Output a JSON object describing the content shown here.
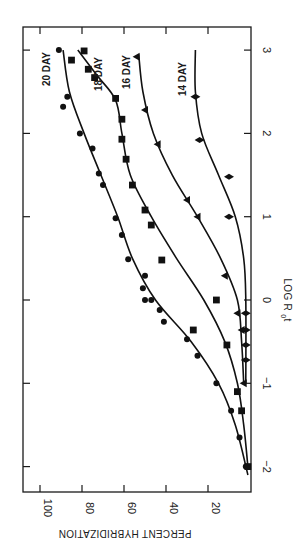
{
  "chart_data": {
    "type": "line",
    "orientation_note_visible": "figure printed rotated 90 degrees clockwise",
    "title": "",
    "xlabel": "LOG R0t",
    "ylabel": "PERCENT HYBRIDIZATION",
    "xlim": [
      -2,
      3
    ],
    "ylim": [
      0,
      100
    ],
    "x_ticks": [
      -2,
      -1,
      0,
      1,
      2,
      3
    ],
    "x_tick_labels": [
      "-2",
      "-1",
      "0",
      "1",
      "2",
      "3"
    ],
    "y_ticks": [
      20,
      40,
      60,
      80,
      100
    ],
    "y_tick_labels": [
      "20",
      "40",
      "60",
      "80",
      "100"
    ],
    "grid": false,
    "legend": "inline labels at curve ends",
    "series": [
      {
        "name": "20 DAY",
        "marker": "circle",
        "points": [
          [
            -2.0,
            2
          ],
          [
            -1.65,
            5
          ],
          [
            -1.33,
            9
          ],
          [
            -1.0,
            16
          ],
          [
            -0.67,
            25
          ],
          [
            -0.47,
            30
          ],
          [
            -0.26,
            41
          ],
          [
            -0.12,
            43
          ],
          [
            0.0,
            47
          ],
          [
            0.0,
            50
          ],
          [
            0.14,
            51
          ],
          [
            0.29,
            50
          ],
          [
            0.49,
            58
          ],
          [
            0.78,
            61
          ],
          [
            0.98,
            64
          ],
          [
            1.38,
            70
          ],
          [
            1.52,
            72
          ],
          [
            1.82,
            75
          ],
          [
            2.0,
            81
          ],
          [
            2.32,
            89
          ],
          [
            2.44,
            87
          ],
          [
            3.0,
            91
          ]
        ],
        "curve": [
          [
            -2.1,
            1
          ],
          [
            -1.5,
            7
          ],
          [
            -1.0,
            15
          ],
          [
            -0.5,
            28
          ],
          [
            0.0,
            45
          ],
          [
            0.5,
            56
          ],
          [
            1.0,
            63
          ],
          [
            1.5,
            71
          ],
          [
            2.0,
            79
          ],
          [
            2.5,
            86
          ],
          [
            3.0,
            89
          ]
        ]
      },
      {
        "name": "18 DAY",
        "marker": "square",
        "points": [
          [
            -2.0,
            1
          ],
          [
            -1.33,
            4
          ],
          [
            -1.1,
            6
          ],
          [
            -0.54,
            11
          ],
          [
            -0.36,
            27
          ],
          [
            0.0,
            16
          ],
          [
            0.48,
            42
          ],
          [
            0.9,
            47
          ],
          [
            1.08,
            50
          ],
          [
            1.38,
            56
          ],
          [
            1.69,
            59
          ],
          [
            1.93,
            61
          ],
          [
            2.17,
            61
          ],
          [
            2.42,
            64
          ],
          [
            2.67,
            74
          ],
          [
            2.77,
            77
          ],
          [
            2.88,
            85
          ],
          [
            2.99,
            79
          ]
        ],
        "curve": [
          [
            -2.0,
            1
          ],
          [
            -1.5,
            3
          ],
          [
            -1.0,
            6
          ],
          [
            -0.5,
            12
          ],
          [
            0.0,
            22
          ],
          [
            0.5,
            35
          ],
          [
            1.0,
            47
          ],
          [
            1.5,
            57
          ],
          [
            2.0,
            61
          ],
          [
            2.4,
            64
          ],
          [
            2.7,
            73
          ],
          [
            3.0,
            82
          ]
        ]
      },
      {
        "name": "16 DAY",
        "marker": "triangle",
        "points": [
          [
            -1.0,
            3
          ],
          [
            -0.36,
            4
          ],
          [
            -0.16,
            6
          ],
          [
            0.29,
            12
          ],
          [
            1.0,
            25
          ],
          [
            1.2,
            30
          ],
          [
            1.87,
            44
          ],
          [
            2.28,
            50
          ],
          [
            2.92,
            54
          ]
        ],
        "curve": [
          [
            -1.0,
            3
          ],
          [
            -0.5,
            4
          ],
          [
            0.0,
            6
          ],
          [
            0.5,
            14
          ],
          [
            1.0,
            25
          ],
          [
            1.5,
            37
          ],
          [
            2.0,
            46
          ],
          [
            2.5,
            51
          ],
          [
            2.95,
            53
          ]
        ]
      },
      {
        "name": "14 DAY",
        "marker": "diamond",
        "points": [
          [
            -0.72,
            2
          ],
          [
            -0.54,
            2
          ],
          [
            -0.36,
            2
          ],
          [
            -0.16,
            2
          ],
          [
            1.0,
            10
          ],
          [
            1.48,
            10
          ],
          [
            1.92,
            24
          ],
          [
            2.44,
            26
          ]
        ],
        "curve": [
          [
            -1.0,
            2
          ],
          [
            0.0,
            2
          ],
          [
            0.5,
            3
          ],
          [
            1.0,
            7
          ],
          [
            1.5,
            15
          ],
          [
            2.0,
            23
          ],
          [
            2.5,
            26
          ],
          [
            3.0,
            26
          ]
        ]
      }
    ]
  },
  "labels": {
    "x_axis": "LOG R",
    "x_axis_sub": "0",
    "x_axis_suffix": "t",
    "y_axis": "PERCENT HYBRIDIZATION"
  }
}
